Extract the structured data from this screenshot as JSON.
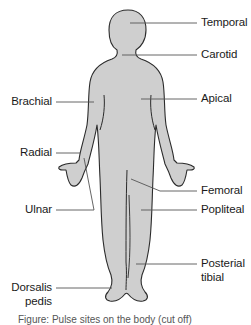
{
  "figure": {
    "colors": {
      "body_fill": "#cfcfcf",
      "body_outline": "#2b2b2b",
      "leader_line": "#555555",
      "label_text": "#1a1a1a",
      "background": "#ffffff"
    },
    "labels_right": [
      {
        "id": "temporal",
        "text": "Temporal",
        "y": 22
      },
      {
        "id": "carotid",
        "text": "Carotid",
        "y": 49
      },
      {
        "id": "apical",
        "text": "Apical",
        "y": 93
      },
      {
        "id": "femoral",
        "text": "Femoral",
        "y": 185
      },
      {
        "id": "popliteal",
        "text": "Popliteal",
        "y": 204
      },
      {
        "id": "posterial-tibial",
        "text": "Posterial",
        "text2": "tibial",
        "y": 258
      }
    ],
    "labels_left": [
      {
        "id": "brachial",
        "text": "Brachial",
        "y": 96
      },
      {
        "id": "radial",
        "text": "Radial",
        "y": 147
      },
      {
        "id": "ulnar",
        "text": "Ulnar",
        "y": 204
      },
      {
        "id": "dorsalis-pedis",
        "text": "Dorsalis",
        "text2": "pedis",
        "y": 282
      }
    ],
    "caption": "Figure: Pulse sites on the body (cut off)"
  }
}
